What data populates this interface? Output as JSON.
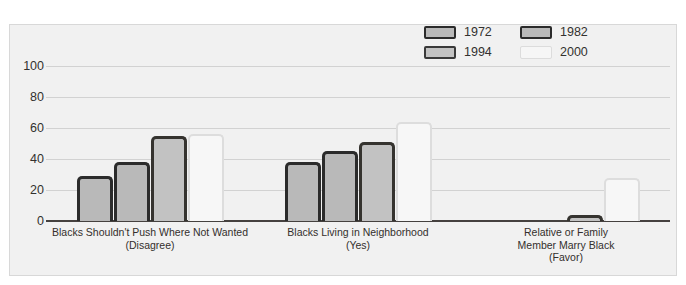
{
  "chart_data": {
    "type": "bar",
    "title": "",
    "subtitle": "",
    "xlabel": "",
    "ylabel": "",
    "ylim": [
      0,
      100
    ],
    "yticks": [
      0,
      20,
      40,
      60,
      80,
      100
    ],
    "ytick_labels": [
      "0",
      "20",
      "40",
      "60",
      "80",
      "100"
    ],
    "grid": true,
    "legend_position": "top-right",
    "grouped": true,
    "categories": [
      "Blacks Shouldn't Push Where Not Wanted\n(Disagree)",
      "Blacks Living in Neighborhood\n(Yes)",
      "Relative or Family\nMember Marry Black\n(Favor)"
    ],
    "series": [
      {
        "name": "1972",
        "values": [
          29,
          38,
          0
        ],
        "color": "#b9b9b9",
        "edge_color": "#2b2b2b"
      },
      {
        "name": "1982",
        "values": [
          38,
          45,
          0
        ],
        "color": "#b9b9b9",
        "edge_color": "#2b2b2b"
      },
      {
        "name": "1994",
        "values": [
          55,
          51,
          4
        ],
        "color": "#c2c2c2",
        "edge_color": "#35332f"
      },
      {
        "name": "2000",
        "values": [
          56,
          64,
          28
        ],
        "color": "#f7f7f7",
        "edge_color": "#dddddd"
      }
    ]
  },
  "legend": {
    "items": [
      {
        "label": "1972",
        "swatch": "legend-swatch-1972"
      },
      {
        "label": "1982",
        "swatch": "legend-swatch-1982"
      },
      {
        "label": "1994",
        "swatch": "legend-swatch-1994"
      },
      {
        "label": "2000",
        "swatch": "legend-swatch-2000"
      }
    ]
  },
  "axis": {
    "y_labels": [
      "100",
      "80",
      "60",
      "40",
      "20",
      "0"
    ]
  },
  "colors": {
    "plot_background": "#f1f1f1",
    "page_background": "#ffffff",
    "gridline": "#d2d2d2",
    "baseline": "#45413f",
    "text": "#33312f"
  }
}
